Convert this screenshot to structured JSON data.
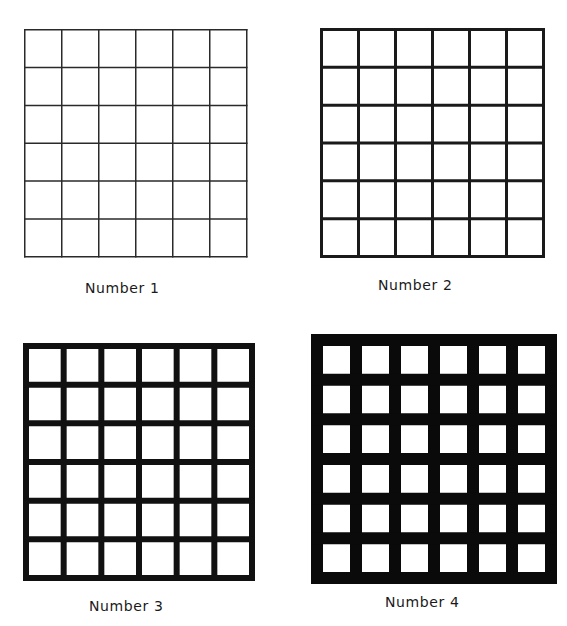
{
  "figure": {
    "panels": [
      {
        "label": "Number 1",
        "rows": 6,
        "cols": 6,
        "line_width": 1.5,
        "line_color": "#2a2a2a",
        "box": {
          "x": 25,
          "y": 30,
          "w": 222,
          "h": 227
        },
        "label_pos": {
          "x": 85,
          "y": 280
        }
      },
      {
        "label": "Number 2",
        "rows": 6,
        "cols": 6,
        "line_width": 3,
        "line_color": "#1a1a1a",
        "box": {
          "x": 321,
          "y": 29,
          "w": 222,
          "h": 227
        },
        "label_pos": {
          "x": 378,
          "y": 277
        }
      },
      {
        "label": "Number 3",
        "rows": 6,
        "cols": 6,
        "line_width": 6,
        "line_color": "#111111",
        "box": {
          "x": 26,
          "y": 346,
          "w": 226,
          "h": 232
        },
        "label_pos": {
          "x": 89,
          "y": 598
        }
      },
      {
        "label": "Number 4",
        "rows": 6,
        "cols": 6,
        "line_width": 12,
        "line_color": "#0a0a0a",
        "box": {
          "x": 317,
          "y": 340,
          "w": 234,
          "h": 238
        },
        "label_pos": {
          "x": 385,
          "y": 594
        }
      }
    ]
  }
}
